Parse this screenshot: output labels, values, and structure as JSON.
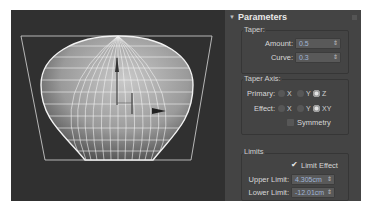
{
  "viewport": {
    "object": "tapered-sphere",
    "gizmo_color": "#e8e8e8",
    "wire_color": "#ffffff",
    "background": "#303030"
  },
  "panel": {
    "rollout_title": "Parameters",
    "taper": {
      "group_label": "Taper:",
      "amount_label": "Amount:",
      "amount_value": "0.5",
      "curve_label": "Curve:",
      "curve_value": "0.3"
    },
    "taper_axis": {
      "group_label": "Taper Axis:",
      "primary_label": "Primary:",
      "primary_options": [
        "X",
        "Y",
        "Z"
      ],
      "primary_selected": "Z",
      "effect_label": "Effect:",
      "effect_options": [
        "X",
        "Y",
        "XY"
      ],
      "effect_selected": "XY",
      "symmetry_label": "Symmetry",
      "symmetry_checked": false
    },
    "limits": {
      "group_label": "Limits",
      "limit_effect_label": "Limit Effect",
      "limit_effect_checked": true,
      "upper_label": "Upper Limit:",
      "upper_value": "4.305cm",
      "lower_label": "Lower Limit:",
      "lower_value": "-12.01cm"
    },
    "spinner_arrows": "⇕"
  }
}
